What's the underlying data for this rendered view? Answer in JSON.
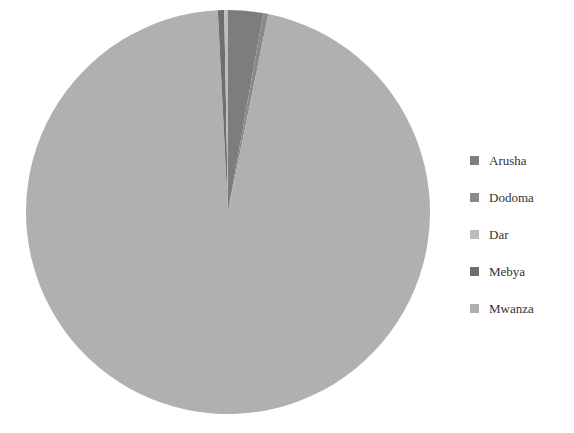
{
  "chart_data": {
    "type": "pie",
    "title": "",
    "categories": [
      "Arusha",
      "Dodoma",
      "Dar",
      "Mebya",
      "Mwanza"
    ],
    "values": [
      2.8,
      0.4,
      0.3,
      0.5,
      96.0
    ],
    "colors": [
      "#7d7d7d",
      "#8a8a8a",
      "#bdbdbd",
      "#6e6e6e",
      "#b0b0b0"
    ],
    "legend_position": "right",
    "start_angle": "12 o'clock, clockwise"
  },
  "legend": {
    "items": [
      {
        "label": "Arusha"
      },
      {
        "label": "Dodoma"
      },
      {
        "label": "Dar"
      },
      {
        "label": "Mebya"
      },
      {
        "label": "Mwanza"
      }
    ]
  }
}
